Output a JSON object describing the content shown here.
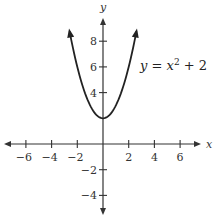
{
  "chart_data": {
    "type": "line",
    "title": "",
    "xlabel": "x",
    "ylabel": "y",
    "xlim": [
      -7.5,
      7.5
    ],
    "ylim": [
      -5.5,
      9.5
    ],
    "grid": false,
    "x_ticks": [
      -6,
      -4,
      -2,
      2,
      4,
      6
    ],
    "y_ticks": [
      8,
      6,
      4,
      -2,
      -4
    ],
    "x_tick_labels": [
      "−6",
      "−4",
      "−2",
      "2",
      "4",
      "6"
    ],
    "y_tick_labels": [
      "8",
      "6",
      "4",
      "−2",
      "−4"
    ],
    "series": [
      {
        "name": "y = x^2 + 2",
        "equation": "y = x^2 + 2",
        "x_range": [
          -2.6,
          2.6
        ],
        "x": [
          -2.6,
          -2,
          -1.5,
          -1,
          -0.5,
          0,
          0.5,
          1,
          1.5,
          2,
          2.6
        ],
        "y": [
          8.76,
          6,
          4.25,
          3,
          2.25,
          2,
          2.25,
          3,
          4.25,
          6,
          8.76
        ],
        "vertex": [
          0,
          2
        ],
        "arrows_at_ends": true
      }
    ],
    "annotations": [
      {
        "text": "y = x² + 2",
        "position": [
          4.5,
          5.8
        ]
      }
    ]
  },
  "labels": {
    "x_axis": "x",
    "y_axis": "y",
    "equation_y": "y",
    "equation_eq": " = ",
    "equation_x": "x",
    "equation_exp": "2",
    "equation_rest": " + 2"
  }
}
